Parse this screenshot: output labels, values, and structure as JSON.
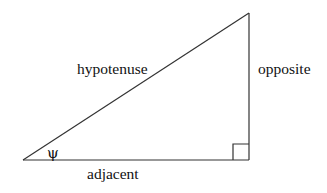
{
  "diagram": {
    "type": "right-triangle",
    "colors": {
      "stroke": "#333333",
      "text": "#111111",
      "background": "#ffffff"
    },
    "labels": {
      "hypotenuse": "hypotenuse",
      "opposite": "opposite",
      "adjacent": "adjacent",
      "angle": "ψ"
    }
  }
}
